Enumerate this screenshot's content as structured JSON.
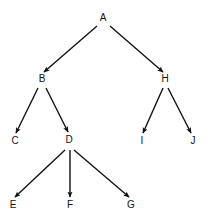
{
  "diagram": {
    "background_color": "#ffffff",
    "edge_color": "#121212",
    "label_color": "#121212",
    "nodes": [
      {
        "id": "A",
        "label": "A",
        "x": 103,
        "y": 21
      },
      {
        "id": "B",
        "label": "B",
        "x": 42,
        "y": 82
      },
      {
        "id": "H",
        "label": "H",
        "x": 165,
        "y": 82
      },
      {
        "id": "C",
        "label": "C",
        "x": 15,
        "y": 144
      },
      {
        "id": "D",
        "label": "D",
        "x": 69,
        "y": 143
      },
      {
        "id": "I",
        "label": "I",
        "x": 142,
        "y": 144
      },
      {
        "id": "J",
        "label": "J",
        "x": 193,
        "y": 144
      },
      {
        "id": "E",
        "label": "E",
        "x": 13,
        "y": 208
      },
      {
        "id": "F",
        "label": "F",
        "x": 70,
        "y": 208
      },
      {
        "id": "G",
        "label": "G",
        "x": 131,
        "y": 208
      }
    ],
    "edges": [
      {
        "id": "A-B",
        "from": "A",
        "to": "B",
        "x1": 97,
        "y1": 26,
        "x2": 44,
        "y2": 72,
        "directed": true
      },
      {
        "id": "A-H",
        "from": "A",
        "to": "H",
        "x1": 110,
        "y1": 26,
        "x2": 163,
        "y2": 72,
        "directed": true
      },
      {
        "id": "B-C",
        "from": "B",
        "to": "C",
        "x1": 38,
        "y1": 88,
        "x2": 16,
        "y2": 133,
        "directed": true
      },
      {
        "id": "B-D",
        "from": "B",
        "to": "D",
        "x1": 46,
        "y1": 88,
        "x2": 68,
        "y2": 132,
        "directed": true
      },
      {
        "id": "H-I",
        "from": "H",
        "to": "I",
        "x1": 163,
        "y1": 88,
        "x2": 143,
        "y2": 133,
        "directed": true
      },
      {
        "id": "H-J",
        "from": "H",
        "to": "J",
        "x1": 168,
        "y1": 88,
        "x2": 191,
        "y2": 133,
        "directed": true
      },
      {
        "id": "D-E",
        "from": "D",
        "to": "E",
        "x1": 65,
        "y1": 150,
        "x2": 15,
        "y2": 197,
        "directed": true
      },
      {
        "id": "D-F",
        "from": "D",
        "to": "F",
        "x1": 70,
        "y1": 150,
        "x2": 70,
        "y2": 197,
        "directed": true
      },
      {
        "id": "D-G",
        "from": "D",
        "to": "G",
        "x1": 74,
        "y1": 150,
        "x2": 129,
        "y2": 197,
        "directed": true
      }
    ]
  }
}
